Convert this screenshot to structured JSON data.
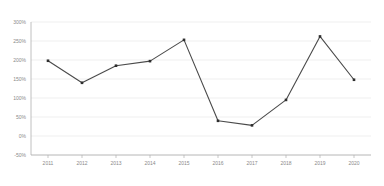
{
  "chart_data": {
    "type": "line",
    "title": "",
    "xlabel": "",
    "ylabel": "",
    "categories": [
      "2011",
      "2012",
      "2013",
      "2014",
      "2015",
      "2016",
      "2017",
      "2018",
      "2019",
      "2020"
    ],
    "values": [
      198,
      140,
      185,
      197,
      253,
      40,
      28,
      95,
      262,
      148
    ],
    "series": [
      {
        "name": "",
        "values": [
          198,
          140,
          185,
          197,
          253,
          40,
          28,
          95,
          262,
          148
        ]
      }
    ],
    "ylim": [
      -50,
      300
    ],
    "yticks": [
      -50,
      0,
      50,
      100,
      150,
      200,
      250,
      300
    ],
    "ytick_labels": [
      "-50%",
      "0%",
      "50%",
      "100%",
      "150%",
      "200%",
      "250%",
      "300%"
    ],
    "xtick_labels": [
      "2011",
      "2012",
      "2013",
      "2014",
      "2015",
      "2016",
      "2017",
      "2018",
      "2019",
      "2020"
    ],
    "grid": true,
    "legend": "none",
    "line_color": "#4a4a4a",
    "marker_color": "#2e2e2e",
    "grid_color": "#e8e8e8",
    "axis_color": "#b0b0b0",
    "tick_text_color": "#8a8a8a",
    "background_color": "#ffffff"
  }
}
